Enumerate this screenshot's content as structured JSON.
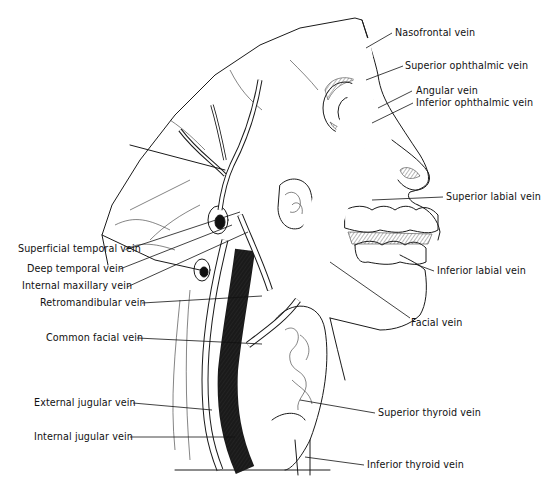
{
  "figure": {
    "labels": {
      "nasofrontal": "Nasofrontal vein",
      "superior_ophthalmic": "Superior ophthalmic vein",
      "angular": "Angular vein",
      "inferior_ophthalmic": "Inferior ophthalmic vein",
      "superior_labial": "Superior labial vein",
      "inferior_labial": "Inferior labial vein",
      "facial": "Facial vein",
      "superficial_temporal": "Superficial temporal vein",
      "deep_temporal": "Deep temporal vein",
      "internal_maxillary": "Internal maxillary vein",
      "retromandibular": "Retromandibular vein",
      "common_facial": "Common facial vein",
      "external_jugular": "External jugular vein",
      "internal_jugular": "Internal jugular vein",
      "superior_thyroid": "Superior thyroid vein",
      "inferior_thyroid": "Inferior thyroid vein"
    }
  }
}
